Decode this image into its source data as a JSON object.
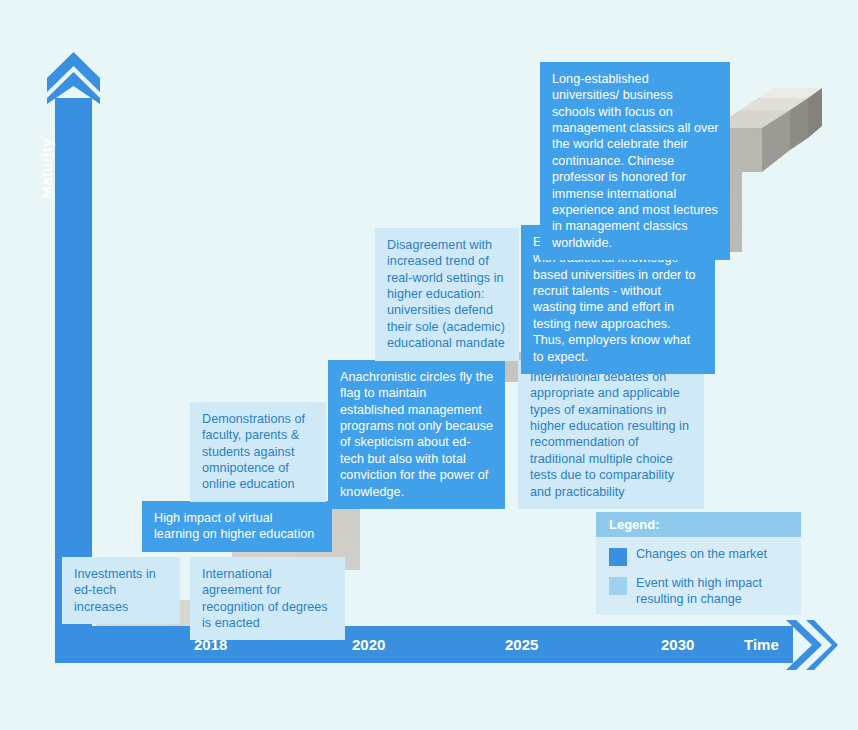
{
  "axes": {
    "y_label": "Maturity",
    "x_title": "Time",
    "x_ticks": [
      {
        "label": "2018",
        "x": 194
      },
      {
        "label": "2020",
        "x": 352
      },
      {
        "label": "2025",
        "x": 505
      },
      {
        "label": "2030",
        "x": 661
      }
    ]
  },
  "colors": {
    "background": "#e9f6f8",
    "axis_blue": "#3a90e0",
    "card_dark": "#41a0ea",
    "card_light": "#cfe9f6",
    "card_light_text": "#2b7fc4",
    "legend_body": "#d7ecf7",
    "legend_header": "#8fcaec",
    "stair_grey": "#c7c3bd"
  },
  "cards": [
    {
      "name": "card-investments-ed-tech",
      "type": "light",
      "text": "Investments in ed-tech increases",
      "x": 62,
      "y": 557,
      "w": 118,
      "h": 48
    },
    {
      "name": "card-international-agreement",
      "type": "light",
      "text": "International agreement for recognition of degrees is enacted",
      "x": 190,
      "y": 557,
      "w": 155,
      "h": 63
    },
    {
      "name": "card-high-impact-virtual-learning",
      "type": "dark",
      "text": "High impact of virtual learning on higher education",
      "x": 142,
      "y": 501,
      "w": 190,
      "h": 47
    },
    {
      "name": "card-demonstrations-faculty",
      "type": "light",
      "text": "Demonstrations of faculty, parents & students against omnipotence of online education",
      "x": 190,
      "y": 402,
      "w": 136,
      "h": 90
    },
    {
      "name": "card-anachronistic-circles",
      "type": "dark",
      "text": "Anachronistic circles fly the flag to maintain established management programs not only because of skepticism about ed-tech but also with total conviction for the power of knowledge.",
      "x": 328,
      "y": 360,
      "w": 177,
      "h": 123
    },
    {
      "name": "card-international-debates",
      "type": "light",
      "text": "International debates on appropriate and applicable types of examinations in higher education resulting in recommendation of traditional multiple choice tests due to comparability and practicability",
      "x": 518,
      "y": 360,
      "w": 186,
      "h": 122
    },
    {
      "name": "card-disagreement-real-world",
      "type": "light",
      "text": "Disagreement with increased trend of real-world settings in higher education: universities defend their sole (academic) educational mandate",
      "x": 375,
      "y": 228,
      "w": 144,
      "h": 118
    },
    {
      "name": "card-employers-strengthen-ties",
      "type": "dark",
      "text": "Employers strengthen ties with traditional knowledge-based universities in order to recruit talents - without wasting time and effort in testing new approaches. Thus, employers know what to expect.",
      "x": 521,
      "y": 225,
      "w": 194,
      "h": 122
    },
    {
      "name": "card-long-established-universities",
      "type": "dark",
      "text": "Long-established universities/ business schools with focus on management classics all over the world celebrate their continuance. Chinese professor is honored for immense international experience and most lectures in management classics worldwide.",
      "x": 540,
      "y": 62,
      "w": 190,
      "h": 152
    }
  ],
  "legend": {
    "title": "Legend:",
    "items": [
      {
        "swatch": "dark",
        "label": "Changes on the market"
      },
      {
        "swatch": "light",
        "label": "Event with high impact resulting in change"
      }
    ]
  }
}
